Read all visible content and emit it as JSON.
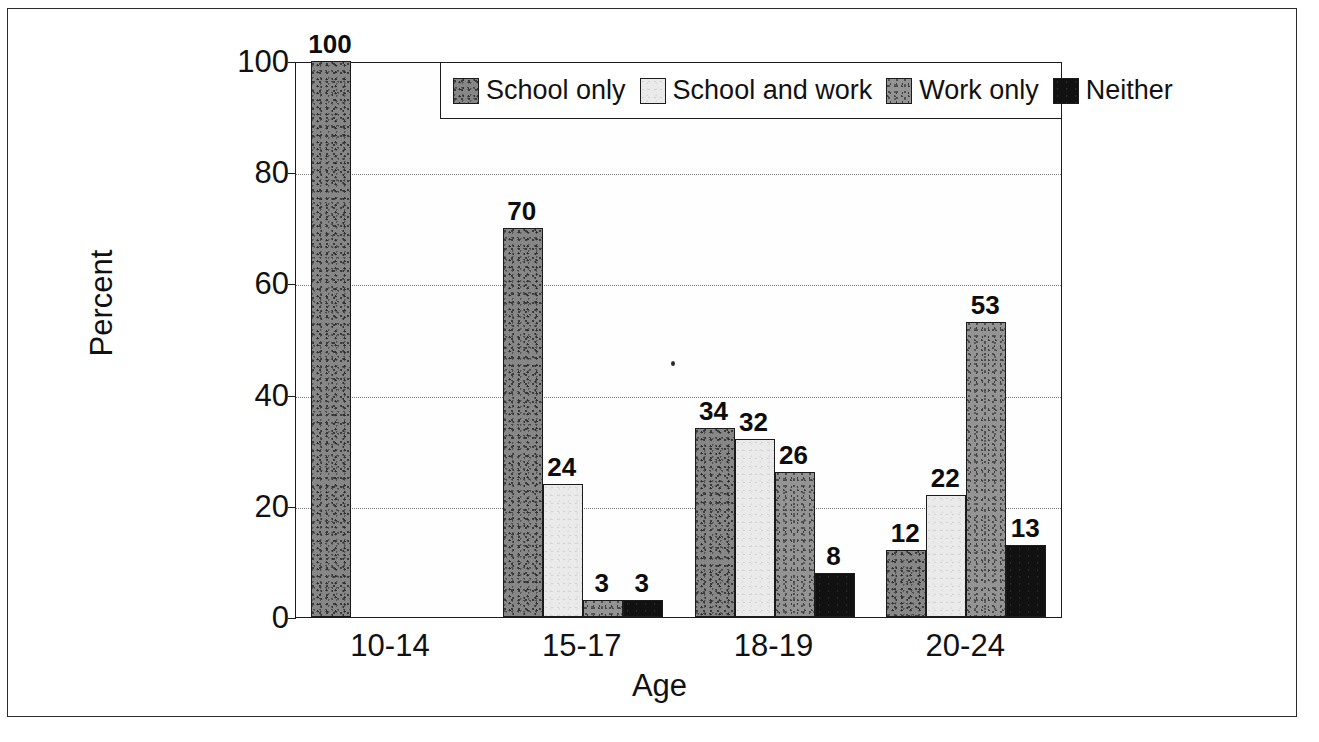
{
  "chart_data": {
    "type": "bar",
    "title": "",
    "xlabel": "Age",
    "ylabel": "Percent",
    "ylim": [
      0,
      100
    ],
    "yticks": [
      "0",
      "20",
      "40",
      "60",
      "80",
      "100"
    ],
    "grid": true,
    "legend_position": "top-right-inside",
    "categories": [
      "10-14",
      "15-17",
      "18-19",
      "20-24"
    ],
    "series": [
      {
        "name": "School only",
        "swatch": "speckled-dark-gray",
        "color": "#878787",
        "values": [
          100,
          70,
          34,
          12
        ],
        "labels": [
          "100",
          "70",
          "34",
          "12"
        ]
      },
      {
        "name": "School and work",
        "swatch": "light-gray",
        "color": "#eaeaea",
        "values": [
          0,
          24,
          32,
          22
        ],
        "labels": [
          "",
          "24",
          "32",
          "22"
        ]
      },
      {
        "name": "Work only",
        "swatch": "speckled-medium-gray",
        "color": "#949494",
        "values": [
          0,
          3,
          26,
          53
        ],
        "labels": [
          "",
          "3",
          "26",
          "53"
        ]
      },
      {
        "name": "Neither",
        "swatch": "solid-black",
        "color": "#111111",
        "values": [
          0,
          3,
          8,
          13
        ],
        "labels": [
          "",
          "3",
          "8",
          "13"
        ]
      }
    ]
  }
}
